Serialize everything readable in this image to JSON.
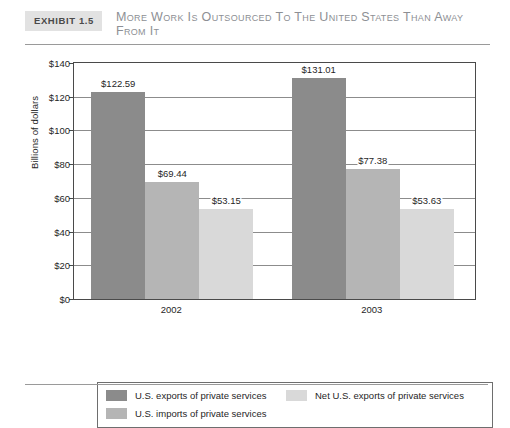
{
  "exhibit": {
    "badge": "Exhibit 1.5",
    "title": "More Work Is Outsourced to the United States Than Away from It"
  },
  "chart_data": {
    "type": "bar",
    "title": "More Work Is Outsourced to the United States Than Away from It",
    "xlabel": "",
    "ylabel": "Billions of dollars",
    "ylim": [
      0,
      140
    ],
    "ytick_labels": [
      "$140",
      "$120",
      "$100",
      "$80",
      "$60",
      "$40",
      "$20",
      "$0"
    ],
    "ytick_values": [
      140,
      120,
      100,
      80,
      60,
      40,
      20,
      0
    ],
    "grid": true,
    "legend_position": "bottom",
    "categories": [
      "2002",
      "2003"
    ],
    "series": [
      {
        "name": "U.S. exports of private services",
        "color": "#8b8b8b",
        "values": [
          122.59,
          131.01
        ],
        "labels": [
          "$122.59",
          "$131.01"
        ]
      },
      {
        "name": "U.S. imports of private services",
        "color": "#b5b5b5",
        "values": [
          69.44,
          77.38
        ],
        "labels": [
          "$69.44",
          "$77.38"
        ]
      },
      {
        "name": "Net U.S. exports of private services",
        "color": "#d9d9d9",
        "values": [
          53.15,
          53.63
        ],
        "labels": [
          "$53.15",
          "$53.63"
        ]
      }
    ]
  },
  "legend": {
    "items": [
      {
        "label": "U.S. exports of private services",
        "color": "#8b8b8b"
      },
      {
        "label": "U.S. imports of private services",
        "color": "#b5b5b5"
      },
      {
        "label": "Net U.S. exports of private services",
        "color": "#d9d9d9"
      }
    ]
  }
}
